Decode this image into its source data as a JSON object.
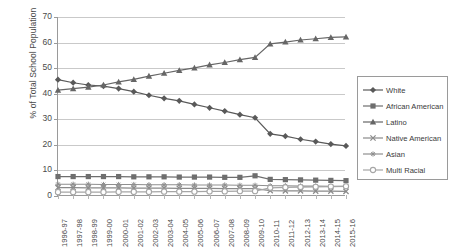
{
  "chart_data": {
    "type": "line",
    "title": "",
    "xlabel": "",
    "ylabel": "% of Total School Population",
    "ylim": [
      0,
      70
    ],
    "yticks": [
      0,
      10,
      20,
      30,
      40,
      50,
      60,
      70
    ],
    "grid": true,
    "legend_position": "right",
    "categories": [
      "1996-97",
      "1997-98",
      "1998-99",
      "1999-00",
      "2000-01",
      "2001-02",
      "2002-03",
      "2003-04",
      "2004-05",
      "2005-06",
      "2006-07",
      "2007-08",
      "2008-09",
      "2009-10",
      "2010-11",
      "2011-12",
      "2012-13",
      "2013-14",
      "2014-15",
      "2015-16"
    ],
    "series": [
      {
        "name": "White",
        "marker": "diamond",
        "color": "#595959",
        "values": [
          45.5,
          44.3,
          43.4,
          43.0,
          42.0,
          40.8,
          39.4,
          38.2,
          37.2,
          35.8,
          34.5,
          33.2,
          31.8,
          30.6,
          24.3,
          23.4,
          22.2,
          21.3,
          20.3,
          19.6
        ]
      },
      {
        "name": "African American",
        "marker": "square",
        "color": "#6e6e6e",
        "values": [
          7.6,
          7.6,
          7.6,
          7.6,
          7.6,
          7.5,
          7.5,
          7.5,
          7.4,
          7.4,
          7.4,
          7.3,
          7.3,
          7.9,
          6.5,
          6.4,
          6.3,
          6.2,
          6.1,
          6.0
        ]
      },
      {
        "name": "Latino",
        "marker": "triangle",
        "color": "#666666",
        "values": [
          41.4,
          42.0,
          42.6,
          43.4,
          44.6,
          45.6,
          46.9,
          48.0,
          49.1,
          50.1,
          51.3,
          52.2,
          53.3,
          54.2,
          59.5,
          60.2,
          61.0,
          61.5,
          62.0,
          62.2
        ]
      },
      {
        "name": "Native American",
        "marker": "cross",
        "color": "#8a8a8a",
        "values": [
          3.3,
          3.3,
          3.2,
          3.2,
          3.2,
          3.1,
          3.1,
          3.1,
          3.0,
          3.0,
          3.0,
          2.9,
          2.9,
          2.9,
          2.1,
          2.0,
          2.0,
          1.9,
          1.9,
          1.8
        ]
      },
      {
        "name": "Asian",
        "marker": "star",
        "color": "#8f8f8f",
        "values": [
          4.6,
          4.6,
          4.6,
          4.5,
          4.5,
          4.5,
          4.4,
          4.4,
          4.4,
          4.3,
          4.3,
          4.3,
          4.2,
          4.2,
          4.0,
          4.0,
          3.9,
          3.9,
          3.8,
          3.8
        ]
      },
      {
        "name": "Multi Racial",
        "marker": "circle",
        "color": "#a6a6a6",
        "values": [
          1.5,
          1.5,
          1.5,
          1.5,
          1.6,
          1.6,
          1.6,
          1.7,
          1.7,
          1.7,
          1.8,
          1.8,
          1.9,
          1.9,
          3.2,
          3.4,
          3.5,
          3.6,
          3.7,
          3.8
        ]
      }
    ]
  }
}
